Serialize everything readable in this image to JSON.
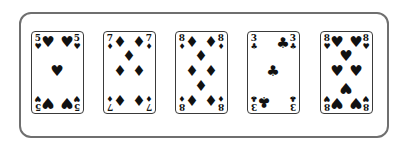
{
  "hand": {
    "cards": [
      {
        "rank": "5",
        "suit": "hearts",
        "symbol": "♥",
        "pip_count": 5
      },
      {
        "rank": "7",
        "suit": "diamonds",
        "symbol": "♦",
        "pip_count": 7
      },
      {
        "rank": "8",
        "suit": "diamonds",
        "symbol": "♦",
        "pip_count": 8
      },
      {
        "rank": "3",
        "suit": "clubs",
        "symbol": "♣",
        "pip_count": 3
      },
      {
        "rank": "8",
        "suit": "hearts",
        "symbol": "♥",
        "pip_count": 8
      }
    ]
  },
  "colors": {
    "frame_border": "#6f6f6f",
    "card_border": "#3a3a3a",
    "ink": "#111111",
    "background": "#ffffff"
  }
}
